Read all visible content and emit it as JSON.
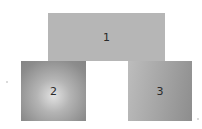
{
  "diagram": {
    "boxes": [
      {
        "label": "1",
        "color": "#b6b6b6"
      },
      {
        "label": "2",
        "color": "#8c8c8c",
        "highlight": "#e2e2e2"
      },
      {
        "label": "3",
        "color": "#a3a3a3"
      }
    ]
  }
}
